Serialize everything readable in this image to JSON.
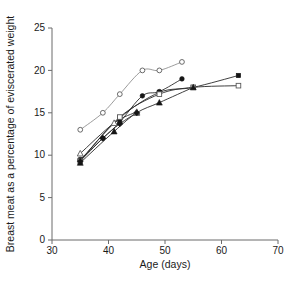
{
  "chart_data": {
    "type": "line",
    "title": "",
    "xlabel": "Age (days)",
    "ylabel": "Breast meat as a percentage of eviscerated weight",
    "xlim": [
      30,
      70
    ],
    "ylim": [
      0,
      25
    ],
    "xticks": [
      30,
      40,
      50,
      60,
      70
    ],
    "yticks": [
      0,
      5,
      10,
      15,
      20,
      25
    ],
    "grid": false,
    "legend": "none",
    "series": [
      {
        "name": "open-circle",
        "marker": "open-circle",
        "line": "light",
        "x": [
          35,
          39,
          42,
          46,
          49,
          53
        ],
        "y": [
          13.0,
          15.0,
          17.2,
          20.0,
          20.0,
          21.0
        ]
      },
      {
        "name": "filled-circle",
        "marker": "filled-circle",
        "line": "dark",
        "x": [
          35,
          39,
          42,
          46,
          49,
          53
        ],
        "y": [
          9.5,
          12.0,
          13.9,
          17.0,
          17.5,
          19.0
        ]
      },
      {
        "name": "filled-square",
        "marker": "filled-square",
        "line": "dark",
        "x": [
          35,
          42,
          49,
          55,
          63
        ],
        "y": [
          9.4,
          14.4,
          17.4,
          18.0,
          19.4
        ]
      },
      {
        "name": "open-square",
        "marker": "open-square",
        "line": "dark",
        "x": [
          35,
          42,
          49,
          55,
          63
        ],
        "y": [
          9.3,
          14.5,
          17.2,
          18.0,
          18.2
        ]
      },
      {
        "name": "filled-triangle",
        "marker": "filled-triangle",
        "line": "dark",
        "x": [
          35,
          41,
          45,
          49,
          55
        ],
        "y": [
          9.1,
          12.8,
          15.0,
          16.2,
          18.0
        ]
      },
      {
        "name": "open-triangle",
        "marker": "open-triangle",
        "line": "dark",
        "x": [
          35,
          41,
          45
        ],
        "y": [
          10.2,
          13.8,
          15.1
        ]
      },
      {
        "name": "filled-diamond",
        "marker": "filled-diamond",
        "line": "dark",
        "x": [
          35,
          39,
          42,
          45
        ],
        "y": [
          9.3,
          12.0,
          13.7,
          15.0
        ]
      }
    ]
  }
}
